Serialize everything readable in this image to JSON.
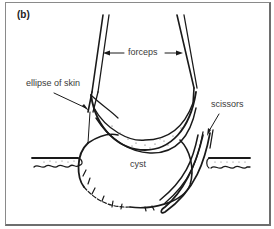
{
  "figure": {
    "panel_label": "(b)",
    "labels": {
      "forceps": "forceps",
      "ellipse_of_skin": "ellipse of skin",
      "scissors": "scissors",
      "cyst": "cyst"
    },
    "colors": {
      "line": "#1a1a1a",
      "text": "#3a3a3a",
      "frame": "#7a7a7a",
      "background": "#ffffff"
    }
  }
}
